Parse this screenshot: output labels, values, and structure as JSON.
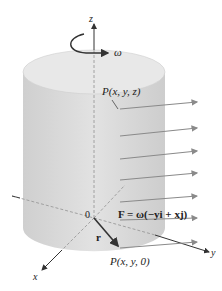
{
  "diagram": {
    "type": "rotating cylinder velocity field",
    "labels": {
      "z_axis": "z",
      "x_axis": "x",
      "y_axis": "y",
      "omega": "ω",
      "point_top": "P(x, y, z)",
      "origin": "0",
      "field_eq": "F = ω(−yi + xj)",
      "r_vector": "r",
      "point_base": "P(x, y, 0)"
    },
    "colors": {
      "cylinder_fill": "#d9d9d9",
      "cylinder_top": "#e6e6e6",
      "field_arrows": "#8a8a8a",
      "axes": "#333333",
      "dashed": "#9a9a9a"
    },
    "field_arrow_count": 6
  }
}
